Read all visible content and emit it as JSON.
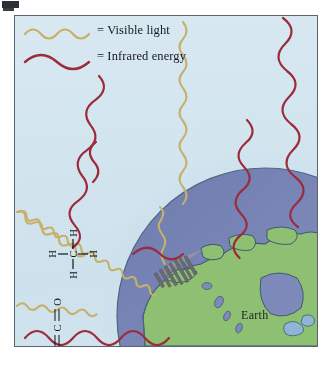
{
  "figure": {
    "earth_label": "Earth"
  },
  "legend": {
    "items": [
      {
        "label": "= Visible light",
        "color": "#c8b169",
        "icon": "wavy-line-icon",
        "wavelength": "short"
      },
      {
        "label": "= Infrared energy",
        "color": "#9d2b3c",
        "icon": "wavy-line-icon",
        "wavelength": "long"
      }
    ]
  },
  "molecules": [
    {
      "name": "methane",
      "formula": "CH4",
      "center_atom": "C",
      "atoms": [
        "H",
        "H",
        "H",
        "H"
      ],
      "bond": "-"
    },
    {
      "name": "carbon-dioxide",
      "formula": "CO2",
      "atoms": [
        "O",
        "C",
        "O"
      ],
      "bond": "="
    }
  ],
  "colors": {
    "sky": "#d4e6f0",
    "atmosphere": "#c3dcea",
    "ocean": "#7a87b8",
    "land": "#8fc173",
    "visible_light": "#c8b169",
    "infrared": "#9d2b3c",
    "border": "#5a6470",
    "city": "#6e6f72",
    "smoke": "#9a9a9a"
  },
  "scene": {
    "earth_name": "Earth",
    "features": [
      "city-skyline",
      "smoke-plume",
      "north-america",
      "great-lakes",
      "hudson-bay",
      "atmosphere-arc"
    ]
  }
}
